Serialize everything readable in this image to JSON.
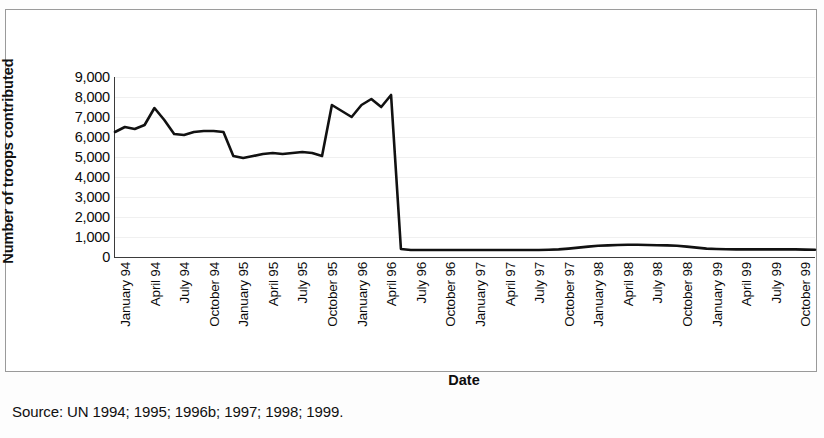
{
  "figure": {
    "source_note": "Source: UN 1994; 1995; 1996b; 1997; 1998; 1999."
  },
  "chart_data": {
    "type": "line",
    "title": "",
    "xlabel": "Date",
    "ylabel": "Number of troops contributed",
    "ylim": [
      0,
      9000
    ],
    "ytick_labels": [
      "9,000",
      "8,000",
      "7,000",
      "6,000",
      "5,000",
      "4,000",
      "3,000",
      "2,000",
      "1,000",
      "0"
    ],
    "yticks": [
      9000,
      8000,
      7000,
      6000,
      5000,
      4000,
      3000,
      2000,
      1000,
      0
    ],
    "grid": true,
    "legend": false,
    "line_color": "#111111",
    "x_tick_labels": [
      "January 94",
      "April 94",
      "July 94",
      "October 94",
      "January 95",
      "April 95",
      "July 95",
      "October 95",
      "January 96",
      "April 96",
      "July 96",
      "October 96",
      "January 97",
      "April 97",
      "July 97",
      "October 97",
      "January 98",
      "April 98",
      "July 98",
      "October 98",
      "January 99",
      "April 99",
      "July 99",
      "October 99"
    ],
    "x": [
      "January 94",
      "February 94",
      "March 94",
      "April 94",
      "May 94",
      "June 94",
      "July 94",
      "August 94",
      "September 94",
      "October 94",
      "November 94",
      "December 94",
      "January 95",
      "February 95",
      "March 95",
      "April 95",
      "May 95",
      "June 95",
      "July 95",
      "August 95",
      "September 95",
      "October 95",
      "November 95",
      "December 95",
      "January 96",
      "February 96",
      "March 96",
      "April 96",
      "May 96",
      "June 96",
      "July 96",
      "August 96",
      "September 96",
      "October 96",
      "November 96",
      "December 96",
      "January 97",
      "February 97",
      "March 97",
      "April 97",
      "May 97",
      "June 97",
      "July 97",
      "August 97",
      "September 97",
      "October 97",
      "November 97",
      "December 97",
      "January 98",
      "February 98",
      "March 98",
      "April 98",
      "May 98",
      "June 98",
      "July 98",
      "August 98",
      "September 98",
      "October 98",
      "November 98",
      "December 98",
      "January 99",
      "February 99",
      "March 99",
      "April 99",
      "May 99",
      "June 99",
      "July 99",
      "August 99",
      "September 99",
      "October 99",
      "November 99",
      "December 99"
    ],
    "values": [
      6250,
      6500,
      6400,
      6600,
      7450,
      6850,
      6150,
      6100,
      6250,
      6300,
      6300,
      6250,
      5050,
      4950,
      5050,
      5150,
      5200,
      5150,
      5200,
      5250,
      5200,
      5050,
      7600,
      7300,
      7000,
      7600,
      7900,
      7500,
      8100,
      400,
      350,
      350,
      350,
      350,
      350,
      350,
      350,
      350,
      350,
      350,
      350,
      350,
      350,
      350,
      360,
      380,
      420,
      470,
      520,
      560,
      580,
      600,
      610,
      610,
      600,
      590,
      580,
      560,
      520,
      470,
      420,
      400,
      390,
      380,
      380,
      380,
      380,
      380,
      380,
      380,
      370,
      360
    ],
    "series_name": "Troops contributed",
    "annotations": [
      {
        "label": "peak",
        "value": 8100,
        "x": "December 95"
      },
      {
        "label": "sharp drop to near zero",
        "value": 400,
        "x": "January 96"
      }
    ]
  }
}
